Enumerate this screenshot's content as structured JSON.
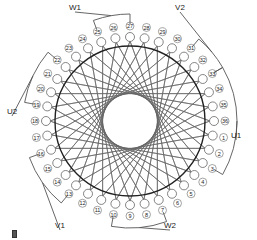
{
  "diagram": {
    "slot_count": 36,
    "center": [
      130,
      121
    ],
    "core_radius": 75,
    "slot_radius": 84,
    "label_radius": 95,
    "first_slot_angle_deg": 10,
    "coil_span": 14,
    "colors": {
      "core": "#222222",
      "coil": "#666666",
      "lead": "#555555",
      "text": "#222222",
      "background": "#ffffff"
    },
    "slots": [
      "1",
      "2",
      "3",
      "4",
      "5",
      "6",
      "7",
      "8",
      "9",
      "10",
      "11",
      "12",
      "13",
      "14",
      "15",
      "16",
      "17",
      "18",
      "19",
      "20",
      "21",
      "22",
      "23",
      "24",
      "25",
      "26",
      "27",
      "28",
      "29",
      "30",
      "31",
      "32",
      "33",
      "34",
      "35",
      "36"
    ],
    "terminals": [
      {
        "label": "U1",
        "slot": 1,
        "x": 236,
        "y": 140,
        "arc_from": 33,
        "arc_to": 3
      },
      {
        "label": "W2",
        "slot": 7,
        "x": 170,
        "y": 230,
        "arc_from": 7,
        "arc_to": 10
      },
      {
        "label": "V1",
        "slot": 13,
        "x": 60,
        "y": 230,
        "arc_from": 13,
        "arc_to": 16
      },
      {
        "label": "U2",
        "slot": 19,
        "x": 12,
        "y": 116,
        "arc_from": 19,
        "arc_to": 22
      },
      {
        "label": "W1",
        "slot": 25,
        "x": 75,
        "y": 12,
        "arc_from": 25,
        "arc_to": 27
      },
      {
        "label": "V2",
        "slot": 31,
        "x": 180,
        "y": 12,
        "arc_from": 31,
        "arc_to": 33
      }
    ]
  }
}
